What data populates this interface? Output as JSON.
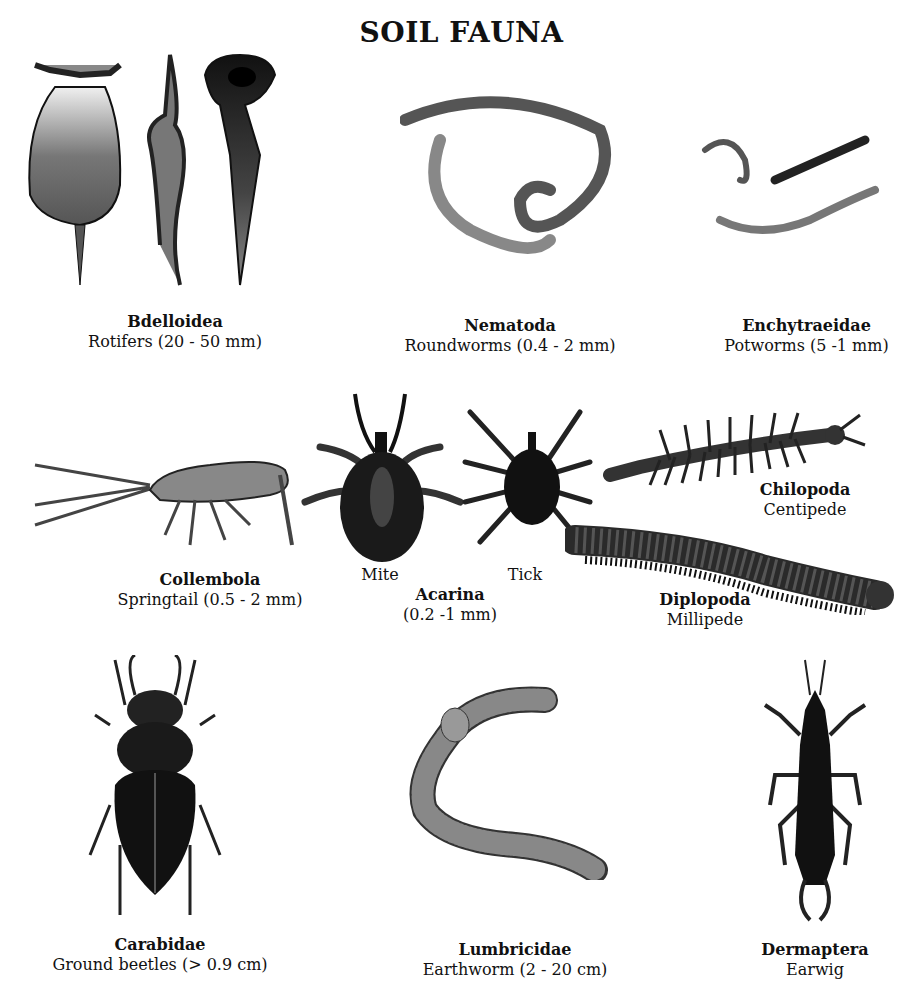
{
  "title": "SOIL FAUNA",
  "organisms": [
    {
      "id": "bdelloidea",
      "scientific": "Bdelloidea",
      "common": "Rotifers  (20 - 50 mm)"
    },
    {
      "id": "nematoda",
      "scientific": "Nematoda",
      "common": "Roundworms (0.4 - 2 mm)"
    },
    {
      "id": "enchytraeidae",
      "scientific": "Enchytraeidae",
      "common": "Potworms (5 -1 mm)"
    },
    {
      "id": "collembola",
      "scientific": "Collembola",
      "common": "Springtail (0.5 - 2 mm)"
    },
    {
      "id": "acarina",
      "scientific": "Acarina",
      "common": "(0.2 -1 mm)",
      "sub_labels": [
        "Mite",
        "Tick"
      ]
    },
    {
      "id": "chilopoda",
      "scientific": "Chilopoda",
      "common": "Centipede"
    },
    {
      "id": "diplopoda",
      "scientific": "Diplopoda",
      "common": "Millipede"
    },
    {
      "id": "carabidae",
      "scientific": "Carabidae",
      "common": "Ground beetles (> 0.9 cm)"
    },
    {
      "id": "lumbricidae",
      "scientific": "Lumbricidae",
      "common": "Earthworm (2 - 20 cm)"
    },
    {
      "id": "dermaptera",
      "scientific": "Dermaptera",
      "common": "Earwig"
    }
  ]
}
